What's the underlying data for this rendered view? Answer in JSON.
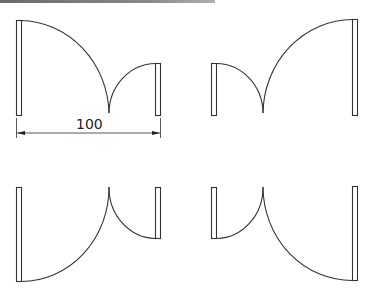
{
  "diagram": {
    "stroke_color": "#333333",
    "dimension": {
      "label": "100",
      "units": "",
      "from_x": 16,
      "to_x": 160,
      "y": 133
    },
    "doors": [
      {
        "id": "top-left",
        "large_leaf": "left",
        "swing": "up"
      },
      {
        "id": "top-right",
        "large_leaf": "right",
        "swing": "up"
      },
      {
        "id": "bottom-left",
        "large_leaf": "left",
        "swing": "down"
      },
      {
        "id": "bottom-right",
        "large_leaf": "right",
        "swing": "down"
      }
    ]
  }
}
